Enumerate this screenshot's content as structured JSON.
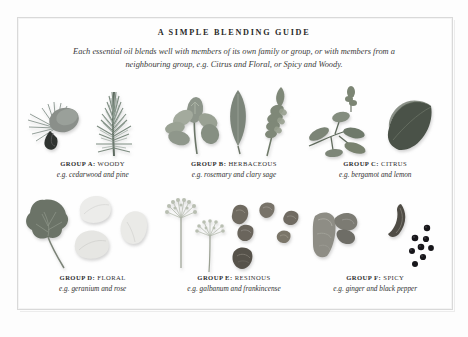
{
  "page": {
    "title": "A SIMPLE BLENDING GUIDE",
    "subtitle_line1": "Each essential oil blends well with members of its own family or group, or with",
    "subtitle_line2": "members from a neighbouring group, e.g. Citrus and Floral, or Spicy and Woody.",
    "frame_color": "#d9d9d9",
    "background_color": "#fdfdfd",
    "text_color": "#2b2b2b"
  },
  "groups": [
    {
      "id": "a",
      "letter": "GROUP A:",
      "name": "WOODY",
      "example": "e.g. cedarwood and pine",
      "specimens": [
        "pine-cone",
        "pine-needle-sprig"
      ]
    },
    {
      "id": "b",
      "letter": "GROUP B:",
      "name": "HERBACEOUS",
      "example": "e.g. rosemary and clary sage",
      "specimens": [
        "sage-sprig",
        "sage-leaf",
        "clary-sage-flower-spike"
      ]
    },
    {
      "id": "c",
      "letter": "GROUP C:",
      "name": "CITRUS",
      "example": "e.g. bergamot and lemon",
      "specimens": [
        "citrus-twig-with-leaves",
        "large-glossy-leaf"
      ]
    },
    {
      "id": "d",
      "letter": "GROUP D:",
      "name": "FLORAL",
      "example": "e.g. geranium and rose",
      "specimens": [
        "geranium-leaf",
        "rose-petal",
        "rose-petal",
        "rose-petal"
      ]
    },
    {
      "id": "e",
      "letter": "GROUP E:",
      "name": "RESINOUS",
      "example": "e.g. galbanum and frankincense",
      "specimens": [
        "galbanum-umbel",
        "galbanum-umbel",
        "resin-lump",
        "resin-lump",
        "resin-lump",
        "resin-lump",
        "resin-lump",
        "resin-lump"
      ]
    },
    {
      "id": "f",
      "letter": "GROUP F:",
      "name": "SPICY",
      "example": "e.g. ginger and black pepper",
      "specimens": [
        "ginger-root",
        "dried-pod",
        "peppercorn-cluster"
      ]
    }
  ]
}
